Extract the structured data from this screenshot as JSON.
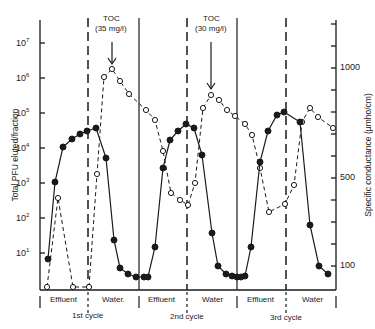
{
  "chart_data": {
    "type": "line",
    "title": "",
    "xlabel": "",
    "ylabel": "Total PFU eluted/fraction",
    "ylabel_right": "Specific conductance (µmho/cm)",
    "y_scale": "log",
    "y_ticks": [
      "10^1",
      "10^2",
      "10^3",
      "10^4",
      "10^5",
      "10^6",
      "10^7"
    ],
    "y_ticks_right": [
      "100",
      "500",
      "1000"
    ],
    "ylim_right": [
      0,
      1200
    ],
    "legend": "none",
    "grid": false,
    "phases": [
      {
        "label": "Effluent",
        "cycle": "1st cycle"
      },
      {
        "label": "Water",
        "cycle": "1st cycle"
      },
      {
        "label": "Effluent",
        "cycle": "2nd cycle"
      },
      {
        "label": "Water",
        "cycle": "2nd cycle"
      },
      {
        "label": "Effluent",
        "cycle": "3rd cycle"
      },
      {
        "label": "Water",
        "cycle": "3rd cycle"
      }
    ],
    "cycles": [
      "1st cycle",
      "2nd cycle",
      "3rd cycle"
    ],
    "annotations": [
      {
        "text": "TOC",
        "sub": "(35 mg/l)",
        "cycle": "1st cycle"
      },
      {
        "text": "TOC",
        "sub": "(30 mg/l)",
        "cycle": "2nd cycle"
      }
    ],
    "series": [
      {
        "name": "Total PFU eluted/fraction (filled circles, solid line)",
        "axis": "left",
        "style": "solid",
        "marker": "filled",
        "points_px": [
          [
            48,
            259
          ],
          [
            55,
            182
          ],
          [
            63,
            147
          ],
          [
            72,
            139
          ],
          [
            80,
            134
          ],
          [
            87,
            131
          ],
          [
            96,
            128
          ],
          [
            106,
            158
          ],
          [
            114,
            240
          ],
          [
            120,
            268
          ],
          [
            128,
            274
          ],
          [
            136,
            277
          ],
          [
            144,
            277
          ],
          [
            148,
            277
          ],
          [
            155,
            247
          ],
          [
            163,
            168
          ],
          [
            170,
            140
          ],
          [
            178,
            131
          ],
          [
            186,
            124
          ],
          [
            194,
            128
          ],
          [
            202,
            155
          ],
          [
            212,
            233
          ],
          [
            218,
            266
          ],
          [
            226,
            274
          ],
          [
            232,
            276
          ],
          [
            237,
            277
          ],
          [
            241,
            277
          ],
          [
            245,
            276
          ],
          [
            251,
            247
          ],
          [
            260,
            162
          ],
          [
            268,
            131
          ],
          [
            277,
            115
          ],
          [
            284,
            112
          ],
          [
            300,
            122
          ],
          [
            310,
            225
          ],
          [
            319,
            266
          ],
          [
            328,
            274
          ]
        ]
      },
      {
        "name": "Specific conductance (open circles, dashed line)",
        "axis": "right",
        "style": "dashed",
        "marker": "open",
        "points_px": [
          [
            47,
            287
          ],
          [
            58,
            198
          ],
          [
            73,
            287
          ],
          [
            89,
            287
          ],
          [
            97,
            174
          ],
          [
            104,
            77
          ],
          [
            112,
            69
          ],
          [
            120,
            81
          ],
          [
            129,
            94
          ],
          [
            146,
            110
          ],
          [
            155,
            120
          ],
          [
            163,
            151
          ],
          [
            171,
            193
          ],
          [
            180,
            200
          ],
          [
            188,
            205
          ],
          [
            195,
            183
          ],
          [
            203,
            108
          ],
          [
            211,
            95
          ],
          [
            219,
            100
          ],
          [
            227,
            110
          ],
          [
            235,
            116
          ],
          [
            245,
            124
          ],
          [
            252,
            135
          ],
          [
            260,
            168
          ],
          [
            269,
            212
          ],
          [
            285,
            204
          ],
          [
            294,
            185
          ],
          [
            302,
            122
          ],
          [
            310,
            108
          ],
          [
            318,
            117
          ],
          [
            333,
            128
          ]
        ]
      }
    ]
  },
  "axis_labels": {
    "left": "Total PFU eluted/fraction",
    "right": "Specific conductance (µmho/cm)",
    "left_ticks": [
      {
        "base": "10",
        "exp": "7"
      },
      {
        "base": "10",
        "exp": "6"
      },
      {
        "base": "10",
        "exp": "5"
      },
      {
        "base": "10",
        "exp": "4"
      },
      {
        "base": "10",
        "exp": "3"
      },
      {
        "base": "10",
        "exp": "2"
      },
      {
        "base": "10",
        "exp": "1"
      }
    ],
    "right_ticks": [
      "1000",
      "500",
      "100"
    ]
  },
  "annotations": {
    "toc1_title": "TOC",
    "toc1_value": "(35 mg/l)",
    "toc2_title": "TOC",
    "toc2_value": "(30 mg/l)"
  },
  "phases": {
    "p1": "Effluent",
    "p2": "Water.",
    "p3": "Effluent",
    "p4": "Water",
    "p5": "Effluent",
    "p6": "Water"
  },
  "cycles": {
    "c1": "1st cycle",
    "c2": "2nd cycle",
    "c3": "3rd cycle"
  }
}
